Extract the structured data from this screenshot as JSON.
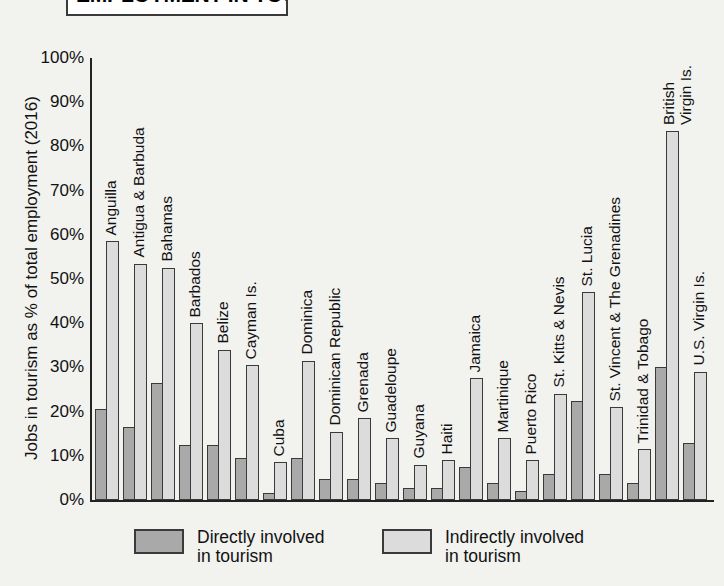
{
  "title": "EMPLOYMENT IN TOURISM",
  "colors": {
    "direct": "#a9a9a9",
    "indirect": "#dcdcdc",
    "outline": "#3a3a3a",
    "background": "#f2f2ef"
  },
  "legend": {
    "direct_label": "Directly involved\nin tourism",
    "indirect_label": "Indirectly involved\nin tourism"
  },
  "chart_data": {
    "type": "bar",
    "title": "EMPLOYMENT IN TOURISM",
    "subtitle": "",
    "xlabel": "",
    "ylabel": "Jobs in tourism as % of total employment (2016)",
    "ylim": [
      0,
      100
    ],
    "yticks": [
      "0%",
      "10%",
      "20%",
      "30%",
      "40%",
      "50%",
      "60%",
      "70%",
      "80%",
      "90%",
      "100%"
    ],
    "ytick_values": [
      0,
      10,
      20,
      30,
      40,
      50,
      60,
      70,
      80,
      90,
      100
    ],
    "grid": false,
    "legend_position": "bottom",
    "categories": [
      "Anguilla",
      "Antigua & Barbuda",
      "Bahamas",
      "Barbados",
      "Belize",
      "Cayman Is.",
      "Cuba",
      "Dominica",
      "Dominican Republic",
      "Grenada",
      "Guadeloupe",
      "Guyana",
      "Haiti",
      "Jamaica",
      "Martinique",
      "Puerto Rico",
      "St. Kitts & Nevis",
      "St. Lucia",
      "St. Vincent & The Grenadines",
      "Trinidad & Tobago",
      "British\nVirgin Is.",
      "U.S. Virgin Is."
    ],
    "series": [
      {
        "name": "Directly involved in tourism",
        "color": "#a9a9a9",
        "values": [
          20.5,
          16.5,
          26.5,
          12.5,
          12.5,
          9.5,
          1.5,
          9.5,
          4.8,
          4.8,
          3.8,
          2.8,
          2.8,
          7.5,
          3.8,
          2.0,
          5.8,
          22.5,
          5.8,
          3.8,
          30.0,
          13.0
        ]
      },
      {
        "name": "Indirectly involved in tourism",
        "color": "#dcdcdc",
        "values": [
          58.5,
          53.5,
          52.5,
          40.0,
          34.0,
          30.5,
          8.5,
          31.5,
          15.5,
          18.5,
          14.0,
          8.0,
          9.0,
          27.5,
          14.0,
          9.0,
          24.0,
          47.0,
          21.0,
          11.5,
          83.5,
          29.0
        ]
      }
    ]
  }
}
